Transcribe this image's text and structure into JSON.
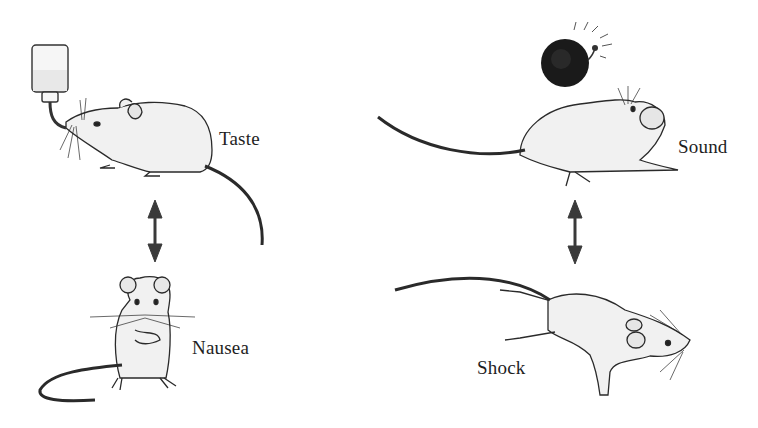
{
  "diagram": {
    "left_pairing": {
      "stimulus": {
        "label": "Taste",
        "icon": "water-bottle-icon"
      },
      "outcome": {
        "label": "Nausea"
      },
      "arrow": "bidirectional-arrow"
    },
    "right_pairing": {
      "stimulus": {
        "label": "Sound",
        "icon": "bell-icon"
      },
      "outcome": {
        "label": "Shock"
      },
      "arrow": "bidirectional-arrow"
    },
    "colors": {
      "line": "#2a2a2a",
      "fill": "#f2f2f2",
      "bell": "#1a1a1a",
      "arrow": "#3a3a3a"
    }
  }
}
